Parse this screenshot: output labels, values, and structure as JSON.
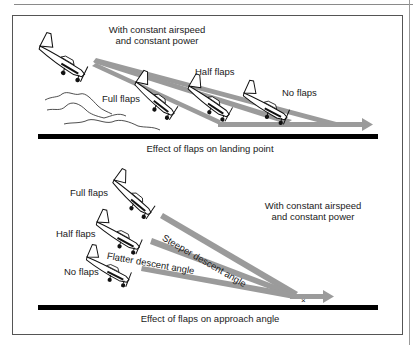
{
  "diagram": {
    "top": {
      "conditions_line1": "With constant airspeed",
      "conditions_line2": "and constant power",
      "labels": {
        "full_flaps": "Full flaps",
        "half_flaps": "Half flaps",
        "no_flaps": "No flaps"
      },
      "caption": "Effect of flaps on landing point"
    },
    "bottom": {
      "conditions_line1": "With constant airspeed",
      "conditions_line2": "and constant power",
      "labels": {
        "full_flaps": "Full flaps",
        "half_flaps": "Half flaps",
        "no_flaps": "No flaps",
        "steeper": "Steeper descent angle",
        "flatter": "Flatter descent angle"
      },
      "touchdown_mark": "×",
      "caption": "Effect of flaps on approach angle"
    },
    "colors": {
      "path_gray": "#9b9b9b",
      "runway": "#000000",
      "frame": "#555555"
    }
  }
}
